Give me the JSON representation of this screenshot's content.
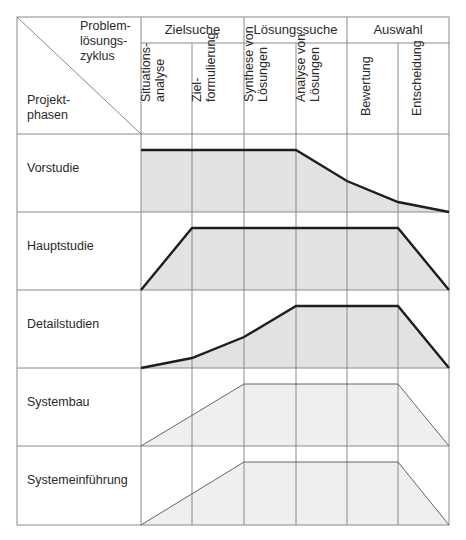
{
  "corner": {
    "top_right_label": [
      "Problem-",
      "lösungs-",
      "zyklus"
    ],
    "bottom_left_label": [
      "Projekt-",
      "phasen"
    ]
  },
  "groups": [
    {
      "label": "Zielsuche"
    },
    {
      "label": "Lösungssuche"
    },
    {
      "label": "Auswahl"
    }
  ],
  "steps": [
    {
      "label": "Situations-\nanalyse"
    },
    {
      "label": "Ziel-\nformulierung"
    },
    {
      "label": "Synthese von\nLösungen"
    },
    {
      "label": "Analyse von\nLösungen"
    },
    {
      "label": "Bewertung"
    },
    {
      "label": "Entscheidung"
    }
  ],
  "phases": [
    {
      "label": "Vorstudie",
      "intensity": [
        1.0,
        1.0,
        1.0,
        0.5,
        0.17,
        0.0
      ],
      "style": "primary"
    },
    {
      "label": "Hauptstudie",
      "intensity": [
        0.0,
        1.0,
        1.0,
        1.0,
        1.0,
        0.0
      ],
      "style": "primary"
    },
    {
      "label": "Detailstudien",
      "intensity": [
        0.0,
        0.16,
        0.5,
        1.0,
        1.0,
        1.0,
        0.0
      ],
      "style": "primary"
    },
    {
      "label": "Systembau",
      "intensity": [
        0.0,
        1.0,
        1.0,
        1.0,
        0.0
      ],
      "style": "secondary"
    },
    {
      "label": "Systemeinführung",
      "intensity": [
        0.0,
        1.0,
        1.0,
        1.0,
        0.0
      ],
      "style": "secondary"
    }
  ],
  "colors": {
    "grid": "#8a8a8a",
    "primary_fill": "#e2e2e2",
    "secondary_fill": "#efefef",
    "primary_line": "#1e1e1e",
    "secondary_line": "#555555"
  }
}
